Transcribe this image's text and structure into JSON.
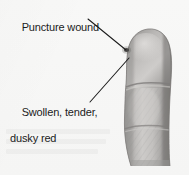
{
  "figure": {
    "background_color": "#f7f7f6",
    "width": 189,
    "height": 175
  },
  "annotations": [
    {
      "id": "puncture",
      "name": "puncture-wound-label",
      "text": "Puncture wound",
      "x": 10,
      "y": 8,
      "leader": {
        "x1": 88,
        "y1": 19,
        "x2": 126,
        "y2": 50
      },
      "points_to": "puncture-wound-mark"
    },
    {
      "id": "swollen",
      "name": "swollen-tender-dusky-red-label",
      "text_line1": "Swollen, tender,",
      "text_line2": "dusky red",
      "x": 10,
      "y": 93,
      "leader": {
        "x1": 90,
        "y1": 102,
        "x2": 129,
        "y2": 58
      },
      "points_to": "finger-body"
    }
  ],
  "illustration": {
    "name": "swollen-finger-drawing",
    "style": "grayscale-halftone-medical-illustration",
    "colors": {
      "skin_light": "#d6d4d2",
      "skin_mid": "#aaa8a6",
      "skin_dark": "#8a8886",
      "skin_shadow": "#6f6d6c",
      "outline": "#7a7876",
      "wound_mark": "#3a3836"
    },
    "features": [
      {
        "name": "fingertip",
        "description": "rounded distal tip, swollen"
      },
      {
        "name": "puncture-wound-mark",
        "description": "small dark puncture dot near tip",
        "x": 126,
        "y": 50
      },
      {
        "name": "distal-crease",
        "description": "interphalangeal joint crease",
        "y": 86
      },
      {
        "name": "proximal-crease",
        "description": "lower joint crease",
        "y": 128
      },
      {
        "name": "finger-base",
        "description": "cut-off base of finger at image bottom"
      }
    ]
  },
  "leader_line": {
    "color": "#1b1b1b",
    "width": 1
  }
}
